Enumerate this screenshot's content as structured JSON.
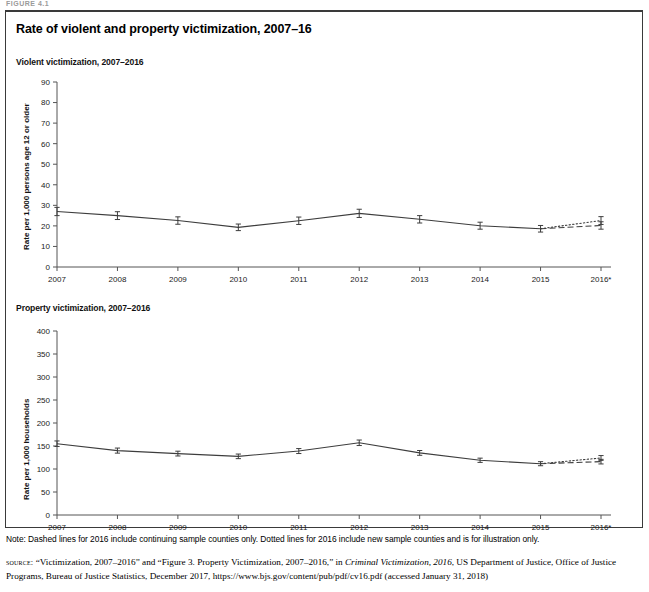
{
  "figure_kicker": "FIGURE 4.1",
  "figure_title": "Rate of violent and property victimization, 2007–16",
  "panels": {
    "violent": {
      "title": "Violent victimization, 2007–2016",
      "ylabel": "Rate per 1,000 persons age 12 or older"
    },
    "property": {
      "title": "Property victimization, 2007–2016",
      "ylabel": "Rate per 1,000 households"
    }
  },
  "note": "Note: Dashed lines for 2016 include continuing sample counties only. Dotted lines for 2016 include new sample counties and is for illustration only.",
  "source": {
    "label": "source:",
    "text_1": "“Victimization, 2007–2016” and “Figure 3. Property Victimization, 2007–2016,” in ",
    "italic_1": "Criminal Victimization, 2016",
    "text_2": ", US Department of Justice, Office of Justice Programs, Bureau of Justice Statistics, December 2017, https://www.bjs.gov/content/pub/pdf/cv16.pdf (accessed January 31, 2018)"
  },
  "chart_data": [
    {
      "type": "line",
      "title": "Violent victimization, 2007–2016",
      "xlabel": "",
      "ylabel": "Rate per 1,000 persons age 12 or older",
      "categories": [
        "2007",
        "2008",
        "2009",
        "2010",
        "2011",
        "2012",
        "2013",
        "2014",
        "2015",
        "2016*"
      ],
      "ylim": [
        0,
        90
      ],
      "ytick_step": 10,
      "yticks": [
        0,
        10,
        20,
        30,
        40,
        50,
        60,
        70,
        80,
        90
      ],
      "grid": false,
      "legend": "none",
      "series": [
        {
          "name": "Violent victimization rate (solid, 2007–2015)",
          "style": "solid",
          "x": [
            "2007",
            "2008",
            "2009",
            "2010",
            "2011",
            "2012",
            "2013",
            "2014",
            "2015"
          ],
          "values": [
            27.0,
            25.0,
            22.6,
            19.3,
            22.5,
            26.1,
            23.2,
            20.1,
            18.6
          ],
          "error_bars": [
            2.0,
            1.9,
            1.8,
            1.6,
            1.8,
            2.0,
            1.8,
            1.7,
            1.6
          ]
        },
        {
          "name": "2016 continuing sample counties (dashed)",
          "style": "dashed",
          "x": [
            "2015",
            "2016*"
          ],
          "values": [
            18.6,
            20.2
          ],
          "error_bars": [
            0,
            1.8
          ]
        },
        {
          "name": "2016 new sample counties (dotted)",
          "style": "dotted",
          "x": [
            "2015",
            "2016*"
          ],
          "values": [
            18.6,
            22.6
          ],
          "error_bars": [
            0,
            1.9
          ]
        }
      ]
    },
    {
      "type": "line",
      "title": "Property victimization, 2007–2016",
      "xlabel": "",
      "ylabel": "Rate per 1,000 households",
      "categories": [
        "2007",
        "2008",
        "2009",
        "2010",
        "2011",
        "2012",
        "2013",
        "2014",
        "2015",
        "2016*"
      ],
      "ylim": [
        0,
        400
      ],
      "ytick_step": 50,
      "yticks": [
        0,
        50,
        100,
        150,
        200,
        250,
        300,
        350,
        400
      ],
      "grid": false,
      "legend": "none",
      "series": [
        {
          "name": "Property victimization rate (solid, 2007–2015)",
          "style": "solid",
          "x": [
            "2007",
            "2008",
            "2009",
            "2010",
            "2011",
            "2012",
            "2013",
            "2014",
            "2015"
          ],
          "values": [
            155.0,
            140.0,
            133.5,
            127.5,
            139.0,
            157.0,
            135.0,
            119.0,
            111.5
          ],
          "error_bars": [
            6.0,
            5.5,
            5.2,
            5.0,
            5.4,
            6.0,
            5.2,
            4.6,
            4.4
          ]
        },
        {
          "name": "2016 continuing sample counties (dashed)",
          "style": "dashed",
          "x": [
            "2015",
            "2016*"
          ],
          "values": [
            111.5,
            116.0
          ],
          "error_bars": [
            0,
            5.0
          ]
        },
        {
          "name": "2016 new sample counties (dotted)",
          "style": "dotted",
          "x": [
            "2015",
            "2016*"
          ],
          "values": [
            111.5,
            124.0
          ],
          "error_bars": [
            0,
            5.2
          ]
        }
      ]
    }
  ]
}
